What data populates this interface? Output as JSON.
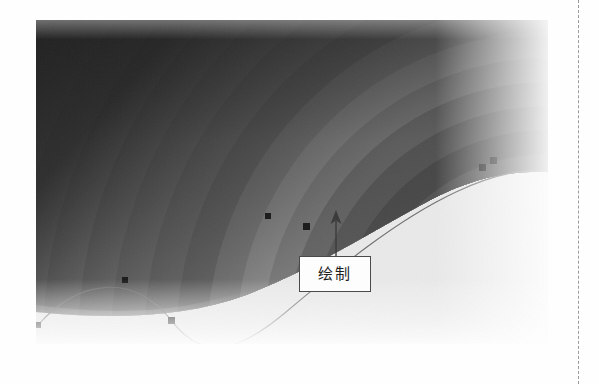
{
  "page": {
    "background_color": "#fefefe",
    "edge_rule": {
      "name": "page-edge-dashed-rule",
      "color": "#9a9a9a",
      "x": 578
    }
  },
  "figure": {
    "bounds": {
      "x": 36,
      "y": 20,
      "width": 512,
      "height": 324
    },
    "dark_fill": "#2e2e2e",
    "light_fill": "#e9e9e9",
    "band_colors": [
      "#2e2e2e",
      "#3a3a3a",
      "#474747",
      "#545454",
      "#636363",
      "#727272",
      "#838383",
      "#949494",
      "#a6a6a6",
      "#b8b8b8",
      "#c9c9c9",
      "#dadada",
      "#e8e8e8",
      "#f2f2f2"
    ],
    "path_stroke": "#6f6f6f",
    "anchor_color": "#1a1a1a"
  },
  "bezier": {
    "name": "editable-bezier-path",
    "stroke_width": 1,
    "anchor_points": [
      {
        "label": "anchor-1",
        "x": 2,
        "y": 305
      },
      {
        "label": "anchor-2",
        "x": 89,
        "y": 260
      },
      {
        "label": "anchor-3",
        "x": 135,
        "y": 300
      },
      {
        "label": "anchor-4",
        "x": 232,
        "y": 196
      },
      {
        "label": "anchor-5",
        "x": 270,
        "y": 206
      },
      {
        "label": "anchor-6",
        "x": 446,
        "y": 147
      },
      {
        "label": "anchor-7",
        "x": 457,
        "y": 140
      }
    ]
  },
  "callout": {
    "name": "annotation-callout",
    "label": "绘制",
    "box": {
      "x": 299,
      "y": 256,
      "width": 72,
      "height": 36
    },
    "border_color": "#4a4a4a",
    "text_color": "#1c1c1c",
    "leader_arrow": {
      "from_y": 258,
      "to_y": 210,
      "x": 336,
      "direction": "up"
    }
  }
}
